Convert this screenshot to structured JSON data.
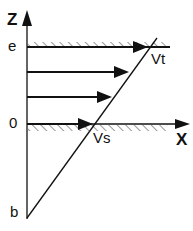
{
  "diagram": {
    "axes": {
      "z_label": "Z",
      "x_label": "X"
    },
    "levels": {
      "top": "e",
      "zero": "0",
      "bottom": "b"
    },
    "velocities": {
      "top": "Vt",
      "surface": "Vs"
    },
    "colors": {
      "line": "#111111",
      "hatch": "#333333",
      "background": "#ffffff"
    }
  }
}
